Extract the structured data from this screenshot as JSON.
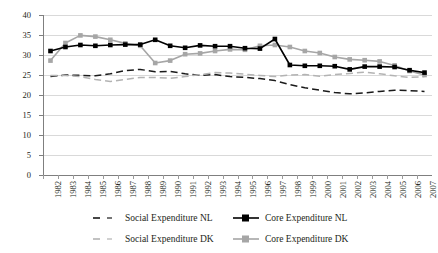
{
  "chart_data": {
    "type": "line",
    "title": "",
    "subtitle": "",
    "xlabel": "",
    "ylabel": "",
    "ylim": [
      0,
      40
    ],
    "ytick_step": 5,
    "yticks": [
      0,
      5,
      10,
      15,
      20,
      25,
      30,
      35,
      40
    ],
    "grid": true,
    "legend_position": "bottom",
    "x": [
      1982,
      1983,
      1984,
      1985,
      1986,
      1987,
      1988,
      1989,
      1990,
      1991,
      1992,
      1993,
      1994,
      1995,
      1996,
      1997,
      1998,
      1999,
      2000,
      2001,
      2002,
      2003,
      2004,
      2005,
      2006,
      2007
    ],
    "categories": [
      "1982",
      "1983",
      "1984",
      "1985",
      "1986",
      "1987",
      "1988",
      "1989",
      "1990",
      "1991",
      "1992",
      "1993",
      "1994",
      "1995",
      "1996",
      "1997",
      "1998",
      "1999",
      "2000",
      "2001",
      "2002",
      "2003",
      "2004",
      "2005",
      "2006",
      "2007"
    ],
    "series": [
      {
        "name": "Social Expenditure NL",
        "color": "#1a1a1a",
        "style": "dashed",
        "marker": "none",
        "values": [
          24.6,
          25.0,
          24.9,
          24.8,
          25.3,
          26.1,
          26.4,
          25.8,
          25.9,
          25.3,
          24.9,
          25.1,
          24.6,
          24.4,
          24.1,
          23.6,
          22.6,
          21.8,
          21.2,
          20.6,
          20.3,
          20.5,
          20.9,
          21.2,
          21.1,
          20.9
        ]
      },
      {
        "name": "Core Expenditure NL",
        "color": "#000000",
        "style": "solid",
        "marker": "square",
        "values": [
          31.0,
          32.0,
          32.5,
          32.3,
          32.5,
          32.6,
          32.6,
          33.8,
          32.3,
          31.8,
          32.4,
          32.2,
          32.2,
          31.7,
          31.6,
          34.0,
          27.5,
          27.3,
          27.3,
          27.2,
          26.4,
          27.1,
          27.1,
          27.0,
          26.2,
          25.6
        ]
      },
      {
        "name": "Social Expenditure DK",
        "color": "#b3b3b3",
        "style": "dashed",
        "marker": "none",
        "values": [
          24.9,
          24.9,
          24.6,
          23.9,
          23.4,
          23.9,
          24.4,
          24.4,
          24.2,
          24.6,
          25.1,
          25.6,
          25.5,
          25.2,
          24.9,
          24.6,
          25.0,
          25.1,
          24.7,
          25.1,
          25.4,
          25.7,
          25.3,
          24.8,
          24.4,
          24.6
        ]
      },
      {
        "name": "Core Expenditure DK",
        "color": "#a6a6a6",
        "style": "solid",
        "marker": "square",
        "values": [
          28.6,
          33.0,
          34.9,
          34.6,
          33.8,
          32.9,
          32.3,
          28.0,
          28.6,
          30.2,
          30.4,
          31.0,
          31.4,
          31.3,
          32.3,
          32.5,
          32.0,
          31.0,
          30.5,
          29.5,
          28.9,
          28.7,
          28.4,
          27.4,
          26.0,
          25.0
        ]
      }
    ]
  },
  "legend": {
    "entries": [
      {
        "label": "Social Expenditure NL"
      },
      {
        "label": "Core Expenditure NL"
      },
      {
        "label": "Social Expenditure DK"
      },
      {
        "label": "Core Expenditure DK"
      }
    ]
  }
}
